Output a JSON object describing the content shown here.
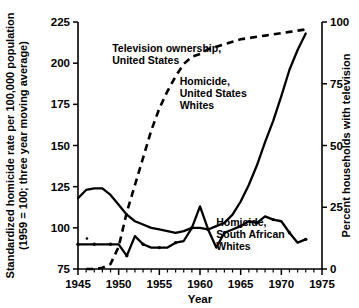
{
  "chart_data": {
    "type": "line",
    "title": "",
    "xlabel": "Year",
    "ylabel_left": "Standardized homicide rate per 100,000 population",
    "ylabel_left_line2": "(1959 = 100; three year moving average)",
    "ylabel_right": "Percent households with television",
    "xlim": [
      1945,
      1975
    ],
    "ylim_left": [
      75,
      225
    ],
    "ylim_right": [
      0,
      100
    ],
    "xticks": [
      1945,
      1950,
      1955,
      1960,
      1965,
      1970,
      1975
    ],
    "xticklabels": [
      "1945",
      "1950",
      "1955",
      "1960",
      "1965",
      "1970",
      "1975"
    ],
    "yticks_left": [
      75,
      100,
      125,
      150,
      175,
      200,
      225
    ],
    "yticklabels_left": [
      "75",
      "100",
      "125",
      "150",
      "175",
      "200",
      "225"
    ],
    "yticks_right": [
      0,
      25,
      50,
      75,
      100
    ],
    "yticklabels_right": [
      "0",
      "25",
      "50",
      "75",
      "100"
    ],
    "grid": false,
    "legend_position": "inline-annotations",
    "annotations": [
      {
        "id": "tv",
        "text_lines": [
          "Television ownership,",
          "United States"
        ],
        "x": 1949.2,
        "y": 207
      },
      {
        "id": "us",
        "text_lines": [
          "Homicide,",
          "United States",
          "Whites"
        ],
        "x": 1957.5,
        "y": 187
      },
      {
        "id": "sa",
        "text_lines": [
          "Homicide,",
          "South African",
          "Whites"
        ],
        "x": 1962.0,
        "y": 101
      }
    ],
    "series": [
      {
        "name": "Television ownership, United States",
        "axis": "right",
        "style": "dashed",
        "x": [
          1946,
          1947,
          1948,
          1949,
          1950,
          1951,
          1952,
          1953,
          1954,
          1955,
          1956,
          1957,
          1958,
          1959,
          1960,
          1961,
          1962,
          1963,
          1964,
          1965,
          1966,
          1967,
          1968,
          1969,
          1970,
          1971,
          1972,
          1973
        ],
        "values": [
          0,
          0,
          0.5,
          2,
          9,
          23,
          34,
          45,
          56,
          65,
          72,
          78,
          83,
          86,
          87,
          89,
          90,
          91,
          92,
          93,
          93.5,
          94,
          94.5,
          95,
          95.5,
          96,
          96.5,
          97
        ]
      },
      {
        "name": "Homicide, United States Whites",
        "axis": "left",
        "style": "solid",
        "x": [
          1945,
          1946,
          1947,
          1948,
          1949,
          1950,
          1951,
          1952,
          1953,
          1954,
          1955,
          1956,
          1957,
          1958,
          1959,
          1960,
          1961,
          1962,
          1963,
          1964,
          1965,
          1966,
          1967,
          1968,
          1969,
          1970,
          1971,
          1972,
          1973
        ],
        "values": [
          118,
          123,
          124,
          124,
          120,
          114,
          108,
          104,
          102,
          100,
          99,
          98,
          97,
          98,
          100,
          100,
          99,
          101,
          103,
          108,
          116,
          126,
          138,
          152,
          165,
          180,
          196,
          208,
          218
        ]
      },
      {
        "name": "Homicide, South African Whites",
        "axis": "left",
        "style": "solid-marked",
        "x": [
          1945,
          1946,
          1947,
          1948,
          1949,
          1950,
          1951,
          1952,
          1953,
          1954,
          1955,
          1956,
          1957,
          1958,
          1959,
          1960,
          1961,
          1962,
          1963,
          1964,
          1965,
          1966,
          1967,
          1968,
          1969,
          1970,
          1971,
          1972,
          1973
        ],
        "values": [
          90,
          90,
          90,
          90,
          90,
          90,
          83,
          95,
          90,
          88,
          88,
          88,
          91,
          92,
          100,
          113,
          99,
          88,
          97,
          99,
          101,
          104,
          103,
          107,
          105,
          104,
          97,
          91,
          93
        ]
      }
    ]
  }
}
